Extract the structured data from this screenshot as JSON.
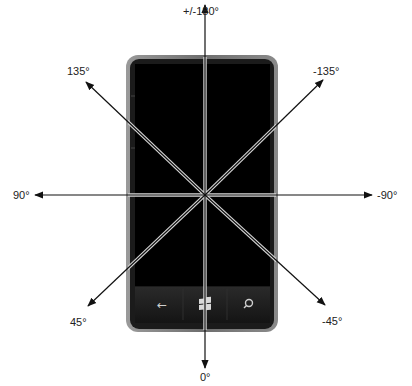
{
  "diagram": {
    "center": {
      "x": 205,
      "y": 195
    },
    "colors": {
      "background": "#ffffff",
      "axis_line": "#111111",
      "axis_on_screen_highlight": "#d8d8d8",
      "phone_bezel": "#8a8a8a",
      "phone_body": "#1b1b1b",
      "screen": "#000000",
      "button_bar": "#1e1e1e",
      "label_text": "#222222"
    },
    "axes": [
      {
        "id": "up",
        "label": "+/-180°",
        "tip": {
          "x": 205,
          "y": 5
        },
        "label_pos": {
          "x": 185,
          "y": 6
        }
      },
      {
        "id": "down",
        "label": "0°",
        "tip": {
          "x": 205,
          "y": 368
        },
        "label_pos": {
          "x": 200,
          "y": 372
        }
      },
      {
        "id": "left",
        "label": "90°",
        "tip": {
          "x": 35,
          "y": 195
        },
        "label_pos": {
          "x": 14,
          "y": 189
        }
      },
      {
        "id": "right",
        "label": "-90°",
        "tip": {
          "x": 372,
          "y": 195
        },
        "label_pos": {
          "x": 378,
          "y": 189
        }
      },
      {
        "id": "up-left",
        "label": "135°",
        "tip": {
          "x": 86,
          "y": 82
        },
        "label_pos": {
          "x": 66,
          "y": 66
        }
      },
      {
        "id": "up-right",
        "label": "-135°",
        "tip": {
          "x": 323,
          "y": 80
        },
        "label_pos": {
          "x": 314,
          "y": 66
        }
      },
      {
        "id": "down-left",
        "label": "45°",
        "tip": {
          "x": 88,
          "y": 306
        },
        "label_pos": {
          "x": 69,
          "y": 316
        }
      },
      {
        "id": "down-right",
        "label": "-45°",
        "tip": {
          "x": 325,
          "y": 305
        },
        "label_pos": {
          "x": 323,
          "y": 315
        }
      }
    ],
    "phone": {
      "body": {
        "x": 128,
        "y": 57,
        "width": 148,
        "height": 273,
        "radius": 10
      },
      "screen": {
        "x": 135,
        "y": 64,
        "width": 135,
        "height": 222
      },
      "buttons": [
        {
          "name": "back",
          "glyph": "←",
          "x": 162
        },
        {
          "name": "start",
          "glyph": "windows-logo",
          "x": 205
        },
        {
          "name": "search",
          "glyph": "search",
          "x": 248
        }
      ]
    }
  }
}
